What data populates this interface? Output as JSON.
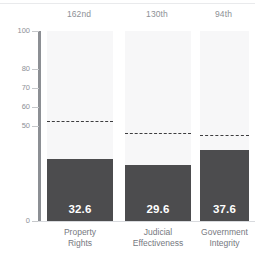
{
  "chart_data": {
    "type": "bar",
    "title": "",
    "subtitle": "",
    "xlabel": "",
    "ylabel": "",
    "ylim": [
      0,
      100
    ],
    "grid": false,
    "legend": "none",
    "categories": [
      "Property Rights",
      "Judicial Effectiveness",
      "Government Integrity"
    ],
    "category_lines": [
      [
        "Property",
        "Rights"
      ],
      [
        "Judicial",
        "Effectiveness"
      ],
      [
        "Government",
        "Integrity"
      ]
    ],
    "values": [
      32.6,
      29.6,
      37.6
    ],
    "value_labels": [
      "32.6",
      "29.6",
      "37.6"
    ],
    "rank_labels": [
      "162nd",
      "130th",
      "94th"
    ],
    "reference_values": [
      52.0,
      46.0,
      44.5
    ],
    "y_ticks": [
      100,
      80,
      70,
      60,
      50,
      0
    ],
    "y_tick_labels": [
      "100",
      "80",
      "70",
      "60",
      "50",
      "0"
    ],
    "track_max": 100,
    "colors": {
      "bar": "#4c4c4e",
      "track": "#f7f7f8",
      "reference_line": "#3d3d3f",
      "axis": "#8c8f94",
      "tick_text": "#8d9096",
      "category_text": "#76797f",
      "rank_text": "#8d9096",
      "value_text": "#ffffff",
      "background": "#ffffff"
    }
  }
}
